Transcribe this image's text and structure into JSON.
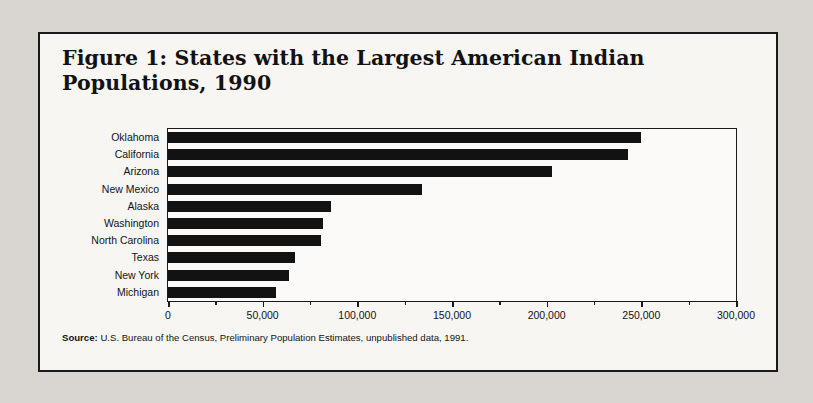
{
  "figure": {
    "title_line1": "Figure 1:  States with the Largest American Indian",
    "title_line2": "Populations, 1990",
    "source_label": "Source:",
    "source_text": " U.S. Bureau of the Census, Preliminary Population Estimates, unpublished data, 1991."
  },
  "chart_data": {
    "type": "bar",
    "orientation": "horizontal",
    "title": "Figure 1:  States with the Largest American Indian Populations, 1990",
    "xlabel": "",
    "ylabel": "",
    "xlim": [
      0,
      300000
    ],
    "grid": false,
    "legend": null,
    "xticks": [
      "0",
      "50,000",
      "100,000",
      "150,000",
      "200,000",
      "250,000",
      "300,000"
    ],
    "xtick_values": [
      0,
      50000,
      100000,
      150000,
      200000,
      250000,
      300000
    ],
    "minor_tick_step": 25000,
    "categories": [
      "Oklahoma",
      "California",
      "Arizona",
      "New Mexico",
      "Alaska",
      "Washington",
      "North Carolina",
      "Texas",
      "New York",
      "Michigan"
    ],
    "values": [
      250000,
      243000,
      203000,
      134000,
      86000,
      82000,
      81000,
      67000,
      64000,
      57000
    ],
    "bar_color": "#121212"
  }
}
